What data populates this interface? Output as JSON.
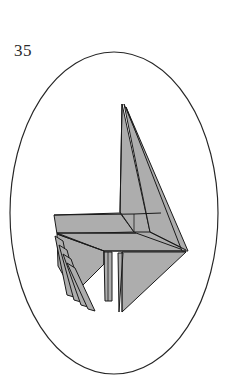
{
  "page": {
    "figure_number": "35",
    "background_color": "#ffffff",
    "width": 230,
    "height": 386
  },
  "frame": {
    "shape": "ellipse",
    "center_x": 114,
    "center_y": 213,
    "radius_x": 104,
    "radius_y": 161,
    "stroke_color": "#262626",
    "stroke_width": 1.15
  },
  "figure": {
    "name": "origami-model",
    "fill_color": "#adadad",
    "line_color": "#1a1a1a",
    "facets": [
      {
        "name": "neck-front-panel",
        "points": "122,104 150,232 134,232 120,212"
      },
      {
        "name": "head-wing-large-triangle",
        "points": "124,104 186,250 150,232"
      },
      {
        "name": "wing-sliver-right",
        "points": "126,107 188,251 183,251"
      },
      {
        "name": "body-upper-left",
        "points": "54,215 120,213 134,232 57,234"
      },
      {
        "name": "body-upper-right",
        "points": "134,214 161,213 186,250 136,250"
      },
      {
        "name": "body-mid-band",
        "points": "57,233 136,233 186,251 104,251"
      },
      {
        "name": "body-lower-left-leg",
        "points": "57,234 104,251 104,262 74,292 60,268"
      },
      {
        "name": "tail-lower-triangle",
        "points": "122,252 186,252 122,312"
      },
      {
        "name": "tail-sliver",
        "points": "119,253 122,253 119,312"
      },
      {
        "name": "center-leg",
        "points": "104,252 112,252 112,300 106,300"
      },
      {
        "name": "skirt-fold-1",
        "points": "55,236 62,240 72,296 66,294"
      },
      {
        "name": "skirt-fold-2",
        "points": "59,244 65,248 78,300 72,298"
      },
      {
        "name": "skirt-fold-3",
        "points": "63,252 69,256 84,304 78,302"
      },
      {
        "name": "skirt-fold-4",
        "points": "67,260 73,264 90,308 84,306"
      }
    ],
    "creases": [
      {
        "name": "crease-neck-spine",
        "path": "M 122,104 L 120,213"
      },
      {
        "name": "crease-body-top",
        "path": "M 54,215 L 134,214 L 161,213"
      },
      {
        "name": "crease-body-mid",
        "path": "M 57,233 L 136,233"
      },
      {
        "name": "crease-body-bottom",
        "path": "M 104,251 L 186,251"
      },
      {
        "name": "crease-left-diagonal",
        "path": "M 57,234 L 104,251"
      },
      {
        "name": "crease-wing-inner",
        "path": "M 150,232 L 186,250"
      },
      {
        "name": "crease-tail-edge",
        "path": "M 122,252 L 122,312"
      },
      {
        "name": "crease-center-leg",
        "path": "M 108,252 L 108,300"
      }
    ]
  }
}
